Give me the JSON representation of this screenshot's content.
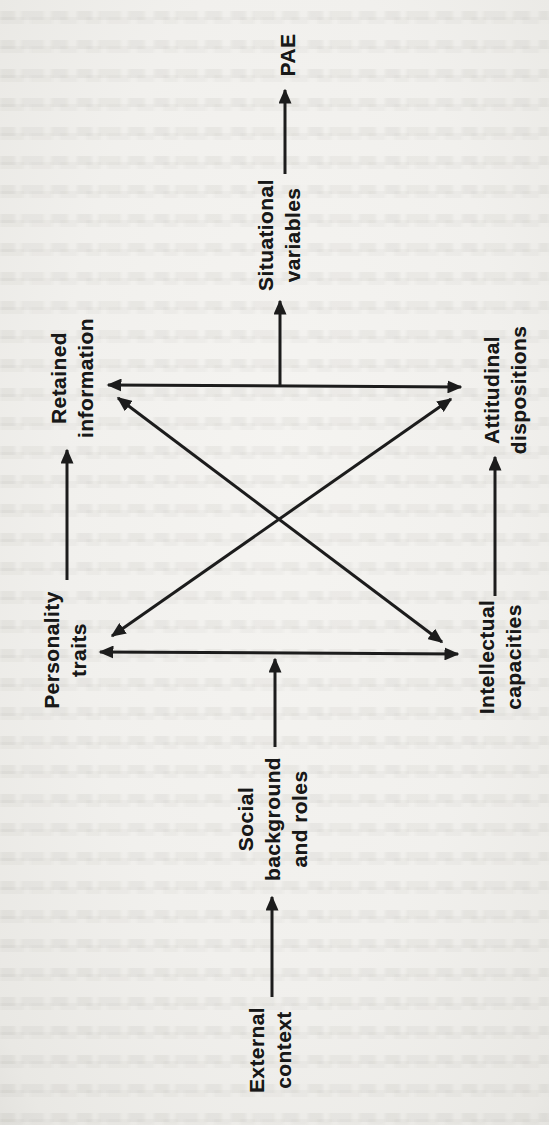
{
  "colors": {
    "paper": "#f1f0ed",
    "ink": "#1c1c1c",
    "bleed_text": "#c9c8c1"
  },
  "diagram": {
    "nodes": [
      {
        "id": "pae",
        "label": "PAE"
      },
      {
        "id": "situational-variables",
        "label": "Situational\nvariables"
      },
      {
        "id": "retained-information",
        "label": "Retained\ninformation"
      },
      {
        "id": "attitudinal-dispositions",
        "label": "Attitudinal\ndispositions"
      },
      {
        "id": "personality-traits",
        "label": "Personality\ntraits"
      },
      {
        "id": "intellectual-capacities",
        "label": "Intellectual\ncapacities"
      },
      {
        "id": "social-background-and-roles",
        "label": "Social\nbackground\nand roles"
      },
      {
        "id": "external-context",
        "label": "External\ncontext"
      }
    ],
    "edges": [
      {
        "id": "edge-external-context-to-social-background",
        "from": "external-context",
        "to": "social-background-and-roles",
        "bidirectional": false,
        "x1": 272,
        "y1": 997,
        "x2": 272,
        "y2": 897
      },
      {
        "id": "edge-social-background-to-lower-link",
        "from": "social-background-and-roles",
        "to": "personality-intellectual-link",
        "bidirectional": false,
        "x1": 275,
        "y1": 747,
        "x2": 275,
        "y2": 659
      },
      {
        "id": "edge-personality-intellectual",
        "from": "personality-traits",
        "to": "intellectual-capacities",
        "bidirectional": true,
        "x1": 100,
        "y1": 652,
        "x2": 458,
        "y2": 654
      },
      {
        "id": "edge-personality-to-retained",
        "from": "personality-traits",
        "to": "retained-information",
        "bidirectional": false,
        "x1": 67,
        "y1": 580,
        "x2": 67,
        "y2": 450
      },
      {
        "id": "edge-intellectual-to-attitudinal",
        "from": "intellectual-capacities",
        "to": "attitudinal-dispositions",
        "bidirectional": false,
        "x1": 495,
        "y1": 596,
        "x2": 495,
        "y2": 457
      },
      {
        "id": "edge-retained-intellectual",
        "from": "retained-information",
        "to": "intellectual-capacities",
        "bidirectional": true,
        "x1": 118,
        "y1": 398,
        "x2": 442,
        "y2": 642
      },
      {
        "id": "edge-personality-attitudinal",
        "from": "personality-traits",
        "to": "attitudinal-dispositions",
        "bidirectional": true,
        "x1": 112,
        "y1": 636,
        "x2": 451,
        "y2": 399
      },
      {
        "id": "edge-retained-attitudinal",
        "from": "retained-information",
        "to": "attitudinal-dispositions",
        "bidirectional": true,
        "x1": 108,
        "y1": 385,
        "x2": 461,
        "y2": 387
      },
      {
        "id": "edge-upper-link-to-situational",
        "from": "retained-attitudinal-link",
        "to": "situational-variables",
        "bidirectional": false,
        "x1": 280,
        "y1": 386,
        "x2": 280,
        "y2": 301
      },
      {
        "id": "edge-situational-to-pae",
        "from": "situational-variables",
        "to": "pae",
        "bidirectional": false,
        "x1": 285,
        "y1": 174,
        "x2": 285,
        "y2": 90
      }
    ]
  }
}
